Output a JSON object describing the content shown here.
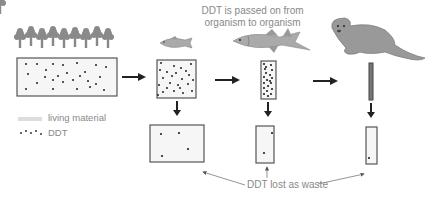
{
  "caption": {
    "line1": "DDT is passed on from",
    "line2": "organism to organism"
  },
  "legend": {
    "living_material_label": "living material",
    "ddt_label": "DDT"
  },
  "waste_label": "DDT lost as waste",
  "levels": [
    {
      "name": "plants",
      "icon": "trees-icon",
      "dots": 26
    },
    {
      "name": "small fish",
      "icon": "small-fish-icon",
      "dots": 24
    },
    {
      "name": "large fish",
      "icon": "large-fish-icon",
      "dots": 20
    },
    {
      "name": "otter",
      "icon": "otter-icon",
      "dots": 30
    }
  ],
  "waste_boxes": [
    {
      "dots": 4
    },
    {
      "dots": 2
    },
    {
      "dots": 1
    }
  ],
  "colors": {
    "box_border": "#555555",
    "box_fill": "#f6f6f6",
    "dot": "#222222",
    "arrow": "#222222",
    "text": "#888888",
    "animal": "#999999",
    "tree": "#8a8a8a"
  }
}
